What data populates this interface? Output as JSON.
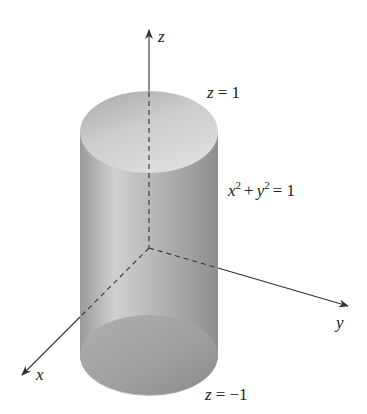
{
  "diagram": {
    "type": "3d-surface-cylinder",
    "surface": {
      "name": "cylinder",
      "equation": {
        "x": "x",
        "x_exp": "2",
        "plus": "+",
        "y": "y",
        "y_exp": "2",
        "eq": "= 1"
      },
      "top_cap": {
        "var": "z",
        "eq": "= 1"
      },
      "bottom_cap": {
        "var": "z",
        "eq": "= −1"
      }
    },
    "axes": {
      "x": "x",
      "y": "y",
      "z": "z"
    },
    "colors": {
      "axis": "#333333",
      "cylinder_dark": "#8f8f8f",
      "cylinder_light": "#d4d4d4",
      "cap_top": "#c8c8c8",
      "cap_bottom": "#a9a9a9"
    }
  }
}
